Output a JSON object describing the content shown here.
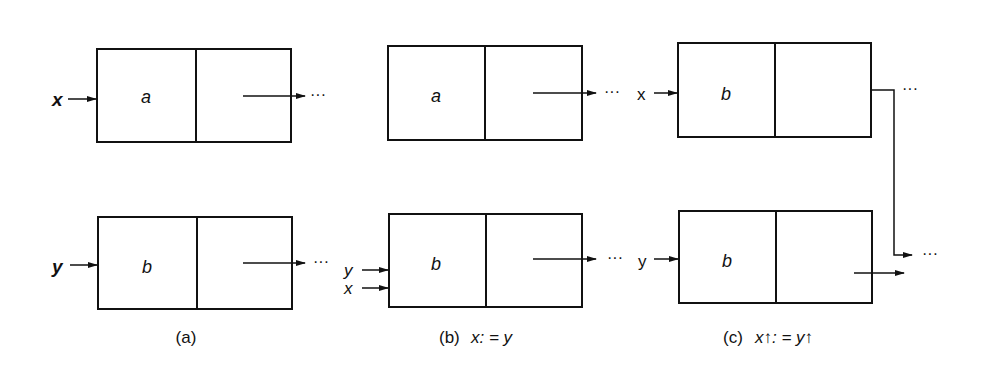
{
  "panels": [
    {
      "id": "a",
      "caption": "(a)",
      "caption_var": "",
      "nodes": [
        {
          "pointer": "x",
          "value": "a",
          "next": "···"
        },
        {
          "pointer": "y",
          "value": "b",
          "next": "···"
        }
      ]
    },
    {
      "id": "b",
      "caption": "(b)",
      "caption_var": "x: = y",
      "nodes": [
        {
          "pointer": "",
          "value": "a",
          "next": "···"
        },
        {
          "pointer": "y",
          "pointer2": "x",
          "value": "b",
          "next": "···"
        }
      ]
    },
    {
      "id": "c",
      "caption": "(c)",
      "caption_var": "x↑: = y↑",
      "nodes": [
        {
          "pointer": "x",
          "value": "b",
          "next": "···"
        },
        {
          "pointer": "y",
          "value": "b",
          "next": "···"
        }
      ]
    }
  ]
}
